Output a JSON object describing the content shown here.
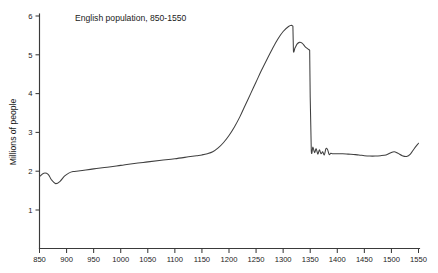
{
  "chart_data": {
    "type": "line",
    "title": "English population,  850-1550",
    "xlabel": "",
    "ylabel": "Millions of people",
    "xlim": [
      850,
      1550
    ],
    "ylim": [
      0,
      6
    ],
    "grid": false,
    "legend": null,
    "xticks": [
      850,
      900,
      950,
      1000,
      1050,
      1100,
      1150,
      1200,
      1250,
      1300,
      1350,
      1400,
      1450,
      1500,
      1550
    ],
    "xtick_labels": [
      "850",
      "900",
      "950",
      "1000",
      "1050",
      "1100",
      "1150",
      "1200",
      "1250",
      "1300",
      "1350",
      "1400",
      "1450",
      "1500",
      "1550"
    ],
    "yticks": [
      1,
      2,
      3,
      4,
      5,
      6
    ],
    "ytick_labels": [
      "1",
      "2",
      "3",
      "4",
      "5",
      "6"
    ],
    "series": [
      {
        "name": "English population",
        "units": "millions of people",
        "x": [
          850,
          858,
          866,
          872,
          880,
          888,
          896,
          904,
          912,
          925,
          950,
          975,
          1000,
          1025,
          1050,
          1075,
          1100,
          1125,
          1140,
          1150,
          1160,
          1170,
          1180,
          1190,
          1200,
          1210,
          1220,
          1230,
          1240,
          1250,
          1260,
          1270,
          1280,
          1290,
          1300,
          1310,
          1316,
          1318,
          1319,
          1322,
          1326,
          1330,
          1335,
          1340,
          1345,
          1348,
          1349,
          1350,
          1352,
          1355,
          1358,
          1361,
          1364,
          1367,
          1370,
          1373,
          1376,
          1379,
          1382,
          1385,
          1388,
          1392,
          1400,
          1410,
          1420,
          1430,
          1440,
          1450,
          1460,
          1470,
          1480,
          1490,
          1498,
          1505,
          1512,
          1520,
          1528,
          1535,
          1542,
          1550
        ],
        "y": [
          1.86,
          1.95,
          1.92,
          1.78,
          1.68,
          1.74,
          1.87,
          1.95,
          1.99,
          2.01,
          2.06,
          2.1,
          2.15,
          2.2,
          2.24,
          2.28,
          2.32,
          2.37,
          2.4,
          2.42,
          2.45,
          2.5,
          2.6,
          2.74,
          2.92,
          3.14,
          3.4,
          3.7,
          4.0,
          4.3,
          4.6,
          4.88,
          5.15,
          5.4,
          5.6,
          5.73,
          5.76,
          5.74,
          5.1,
          5.18,
          5.28,
          5.32,
          5.3,
          5.22,
          5.16,
          5.13,
          5.12,
          3.9,
          2.53,
          2.62,
          2.48,
          2.58,
          2.44,
          2.55,
          2.45,
          2.5,
          2.42,
          2.58,
          2.56,
          2.43,
          2.46,
          2.45,
          2.45,
          2.45,
          2.44,
          2.43,
          2.42,
          2.4,
          2.39,
          2.39,
          2.4,
          2.42,
          2.47,
          2.5,
          2.46,
          2.4,
          2.38,
          2.44,
          2.58,
          2.72
        ]
      }
    ],
    "notes": {
      "peak_value": 5.76,
      "peak_year": 1316,
      "crash_label": "Black Death",
      "crash_year": 1349,
      "post_crash_value": 2.5,
      "start_value": 1.86,
      "end_value": 2.72
    }
  },
  "axes": {
    "y_axis_title": "Millions of people"
  }
}
